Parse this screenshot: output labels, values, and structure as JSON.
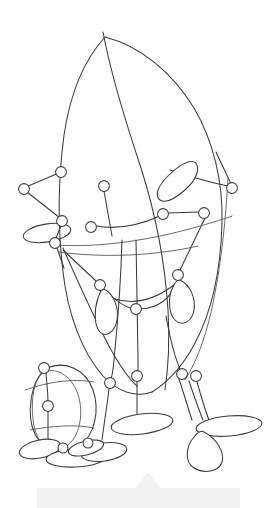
{
  "canvas": {
    "width": 277,
    "height": 508,
    "background": "#ffffff",
    "title": "Wireframe pose line drawing"
  },
  "style": {
    "stroke_color": "#3b3b3b",
    "stroke_color_light": "#5a5a5a",
    "stroke_width": 1.05,
    "joint_fill": "#ffffff",
    "joint_radius": 5.2,
    "watermark_color": "#f2f2f2"
  },
  "figure": {
    "label": "line-art pose skeleton of two figures",
    "torso": {
      "label": "large leaf shaped torso outline",
      "apex": [
        105,
        37
      ]
    },
    "small_figure": {
      "label": "small oval figure lower left",
      "center": [
        62,
        408
      ]
    }
  },
  "joints": [
    {
      "name": "left-hand-outer",
      "cx": 24,
      "cy": 189,
      "r": 5.4
    },
    {
      "name": "left-elbow-upper",
      "cx": 61,
      "cy": 172,
      "r": 5.4
    },
    {
      "name": "left-elbow-lower",
      "cx": 62,
      "cy": 221,
      "r": 5.4
    },
    {
      "name": "left-wrist",
      "cx": 55,
      "cy": 243,
      "r": 5.4
    },
    {
      "name": "neck-joint",
      "cx": 104,
      "cy": 186,
      "r": 5.4
    },
    {
      "name": "chest-joint",
      "cx": 91,
      "cy": 227,
      "r": 5.4
    },
    {
      "name": "right-shoulder",
      "cx": 232,
      "cy": 188,
      "r": 5.4
    },
    {
      "name": "mid-spine-joint",
      "cx": 163,
      "cy": 214,
      "r": 5.4
    },
    {
      "name": "right-rib-joint",
      "cx": 204,
      "cy": 213,
      "r": 5.4
    },
    {
      "name": "left-hip-joint",
      "cx": 100,
      "cy": 285,
      "r": 5.4
    },
    {
      "name": "pelvis-joint",
      "cx": 136,
      "cy": 309,
      "r": 5.4
    },
    {
      "name": "right-hip-joint",
      "cx": 178,
      "cy": 275,
      "r": 5.4
    },
    {
      "name": "left-knee",
      "cx": 110,
      "cy": 383,
      "r": 5.4
    },
    {
      "name": "left-ankle-inner",
      "cx": 137,
      "cy": 376,
      "r": 5.4
    },
    {
      "name": "right-knee",
      "cx": 182,
      "cy": 374,
      "r": 5.4
    },
    {
      "name": "right-ankle",
      "cx": 196,
      "cy": 376,
      "r": 5.4
    },
    {
      "name": "small-head-joint",
      "cx": 44,
      "cy": 368,
      "r": 5.4
    },
    {
      "name": "small-body-joint",
      "cx": 48,
      "cy": 406,
      "r": 5.4
    },
    {
      "name": "small-foot-joint-a",
      "cx": 63,
      "cy": 448,
      "r": 5.0
    },
    {
      "name": "small-foot-joint-b",
      "cx": 88,
      "cy": 443,
      "r": 5.0
    }
  ],
  "watermark": {
    "label": "faint gray band with peak",
    "band": {
      "x": 37,
      "y": 488,
      "width": 203,
      "height": 20
    },
    "peak": {
      "apex_x": 148,
      "apex_y": 472,
      "base_half_width": 13
    }
  }
}
